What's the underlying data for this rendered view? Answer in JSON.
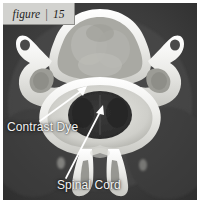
{
  "figure": {
    "tag_word": "figure",
    "tag_separator": "|",
    "tag_number": "15",
    "modality": "CT",
    "view": "axial cervical vertebra cross-section"
  },
  "annotations": [
    {
      "id": "contrast-dye",
      "label": "Contrast Dye",
      "arrow": "points up-right from label to bright contrast ring inside spinal canal"
    },
    {
      "id": "spinal-cord",
      "label": "Spinal Cord",
      "arrow": "points up-right from label to dark oval cord within the canal"
    }
  ],
  "labels": {
    "contrast_dye": "Contrast Dye",
    "spinal_cord": "Spinal Cord"
  },
  "colors": {
    "tag_background": "#d2d2cf",
    "tag_text": "#1d1d1d",
    "annotation_text": "#f2f2f2",
    "arrow_fill": "#ffffff",
    "scan_background": "#3a3a3a",
    "bone_bright": "#f3f3f0",
    "soft_tissue": "#8d8d8a",
    "canal_dark": "#2a2a2a",
    "page_background": "#ffffff"
  }
}
